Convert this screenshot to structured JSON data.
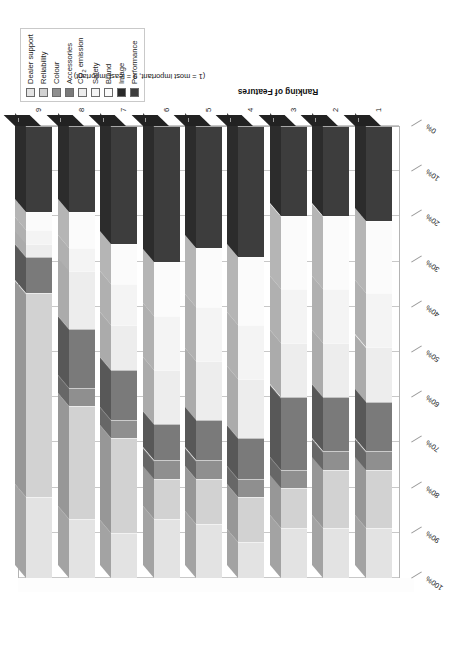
{
  "chart_data": {
    "type": "bar",
    "orientation": "horizontal-stacked-3d",
    "title": "",
    "xlabel": "Ranking of Features",
    "xsublabel": "(1 = most important, 9 = least important)",
    "ylabel": "",
    "categories": [
      "1",
      "2",
      "3",
      "4",
      "5",
      "6",
      "7",
      "8",
      "9"
    ],
    "ytick_labels": [
      "0%",
      "10%",
      "20%",
      "30%",
      "40%",
      "50%",
      "60%",
      "70%",
      "80%",
      "90%",
      "100%"
    ],
    "ylim": [
      0,
      100
    ],
    "grid": true,
    "legend_position": "top-right",
    "stack_order_from_zero": [
      "Performance",
      "Image",
      "Brand",
      "Safety",
      "CO2 emission",
      "Accessories",
      "Colour",
      "Reliability",
      "Dealer support"
    ],
    "series": [
      {
        "name": "Performance",
        "color": "#3d3d3d",
        "values": [
          21,
          20,
          20,
          29,
          27,
          30,
          26,
          19,
          19
        ]
      },
      {
        "name": "Image",
        "color": "#2a2a2a",
        "values": [
          0,
          0,
          0,
          0,
          0,
          0,
          0,
          0,
          0
        ]
      },
      {
        "name": "Brand",
        "color": "#fbfbfb",
        "values": [
          16,
          16,
          16,
          15,
          13,
          12,
          9,
          8,
          4
        ]
      },
      {
        "name": "Safety",
        "color": "#f4f4f4",
        "values": [
          12,
          12,
          12,
          12,
          12,
          12,
          9,
          5,
          3
        ]
      },
      {
        "name": "CO2 emission",
        "color": "#ededed",
        "values": [
          12,
          12,
          12,
          13,
          13,
          12,
          10,
          13,
          3
        ]
      },
      {
        "name": "Accessories",
        "color": "#7a7a7a",
        "values": [
          11,
          12,
          16,
          9,
          9,
          8,
          11,
          13,
          8
        ]
      },
      {
        "name": "Colour",
        "color": "#8f8f8f",
        "values": [
          4,
          4,
          4,
          4,
          4,
          4,
          4,
          4,
          0
        ]
      },
      {
        "name": "Reliability",
        "color": "#d2d2d2",
        "values": [
          13,
          13,
          9,
          10,
          10,
          9,
          21,
          25,
          45
        ]
      },
      {
        "name": "Dealer support",
        "color": "#e3e3e3",
        "values": [
          11,
          11,
          11,
          8,
          12,
          13,
          10,
          13,
          18
        ]
      }
    ]
  },
  "legend": {
    "items": [
      {
        "label": "Dealer support",
        "color": "#e3e3e3",
        "name": "legend-dealer-support"
      },
      {
        "label": "Reliability",
        "color": "#d2d2d2",
        "name": "legend-reliability"
      },
      {
        "label": "Colour",
        "color": "#8f8f8f",
        "name": "legend-colour"
      },
      {
        "label": "Accessories",
        "color": "#7a7a7a",
        "name": "legend-accessories"
      },
      {
        "label": "CO₂ emission",
        "color": "#ededed",
        "name": "legend-co2-emission"
      },
      {
        "label": "Safety",
        "color": "#f4f4f4",
        "name": "legend-safety"
      },
      {
        "label": "Brand",
        "color": "#fbfbfb",
        "name": "legend-brand"
      },
      {
        "label": "Image",
        "color": "#2a2a2a",
        "name": "legend-image"
      },
      {
        "label": "Performance",
        "color": "#3d3d3d",
        "name": "legend-performance"
      }
    ]
  },
  "axes": {
    "x_title": "Ranking of Features",
    "x_subtitle": "(1 = most important, 9 = least important)"
  }
}
